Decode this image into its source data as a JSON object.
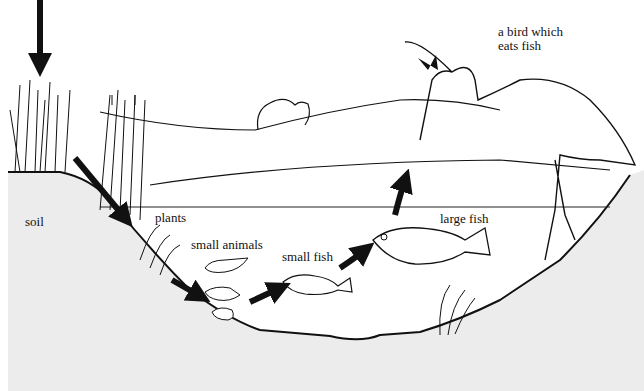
{
  "diagram": {
    "type": "pond food chain illustration",
    "colors": {
      "soil": "#ececec",
      "water": "#ffffff",
      "line": "#111111",
      "arrow": "#111111"
    },
    "labels": {
      "soil": "soil",
      "plants": "plants",
      "small_animals": "small animals",
      "small_fish": "small fish",
      "large_fish": "large fish",
      "bird_line1": "a bird which",
      "bird_line2": "eats fish"
    },
    "food_chain": [
      "sunlight",
      "plants",
      "small animals",
      "small fish",
      "large fish",
      "a bird which eats fish"
    ]
  }
}
